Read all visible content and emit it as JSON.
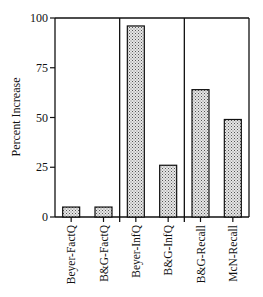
{
  "chart_data": {
    "type": "bar",
    "title": "",
    "xlabel": "",
    "ylabel": "Percent Increase",
    "ylim": [
      0,
      100
    ],
    "yticks": [
      0,
      25,
      50,
      75,
      100
    ],
    "ytick_labels": [
      "0",
      "25",
      "50",
      "75",
      "100"
    ],
    "grid": false,
    "legend": "none",
    "bar_pattern": "dotted-gray",
    "groups": [
      {
        "categories": [
          "Beyer-FactQ",
          "B&G-FactQ"
        ],
        "values": [
          5,
          5
        ]
      },
      {
        "categories": [
          "Beyer-InfQ",
          "B&G-InfQ"
        ],
        "values": [
          96,
          26
        ]
      },
      {
        "categories": [
          "B&G-Recall",
          "McN-Recall"
        ],
        "values": [
          64,
          49
        ]
      }
    ],
    "categories": [
      "Beyer-FactQ",
      "B&G-FactQ",
      "Beyer-InfQ",
      "B&G-InfQ",
      "B&G-Recall",
      "McN-Recall"
    ],
    "values": [
      5,
      5,
      96,
      26,
      64,
      49
    ]
  }
}
